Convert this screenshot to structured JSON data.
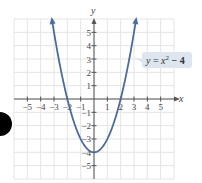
{
  "chart_data": {
    "type": "line",
    "title": "",
    "function": "y = x^2 - 4",
    "label": {
      "y": "y",
      "eq": " = ",
      "x": "x",
      "exp": "2",
      "rest": " − 4"
    },
    "xlabel": "x",
    "ylabel": "y",
    "xlim": [
      -6,
      6
    ],
    "ylim": [
      -6,
      6
    ],
    "grid": true,
    "x_ticks": [
      -5,
      -4,
      -3,
      -2,
      -1,
      1,
      2,
      3,
      4,
      5
    ],
    "x_tick_labels": [
      "−5",
      "−4",
      "−3",
      "−2",
      "−1",
      "1",
      "2",
      "3",
      "4",
      "5"
    ],
    "y_ticks": [
      5,
      4,
      3,
      2,
      1,
      -1,
      -2,
      -3,
      -4,
      -5
    ],
    "y_tick_labels": [
      "5",
      "4",
      "3",
      "2",
      "1",
      "−1",
      "−2",
      "−3",
      "−4",
      "−5"
    ],
    "domain": [
      -3.15,
      3.15
    ],
    "key_points": [
      {
        "x": -2,
        "y": 0,
        "note": "x-intercept"
      },
      {
        "x": 2,
        "y": 0,
        "note": "x-intercept"
      },
      {
        "x": 0,
        "y": -4,
        "note": "vertex"
      }
    ],
    "sample_points": {
      "x": [
        -3,
        -2,
        -1,
        0,
        1,
        2,
        3
      ],
      "y": [
        5,
        0,
        -3,
        -4,
        -3,
        0,
        5
      ]
    }
  },
  "colors": {
    "curve": "#4b6b9c",
    "grid": "#e4e4e4",
    "axis": "#555555",
    "label_bg": "#dde6ee",
    "marker": "#000000"
  }
}
